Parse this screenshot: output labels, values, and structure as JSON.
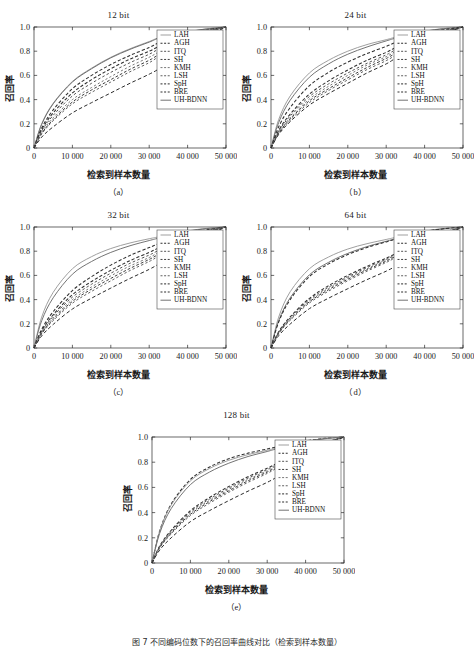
{
  "figure": {
    "caption": "图 7   不同编码位数下的召回率曲线对比（检索到样本数量）",
    "yaxis_label": "召回率",
    "xaxis_label": "检索到样本数量",
    "xticks": [
      "0",
      "10 000",
      "20 000",
      "30 000",
      "40 000",
      "50 000"
    ],
    "xtick_values": [
      0,
      10000,
      20000,
      30000,
      40000,
      50000
    ],
    "yticks": [
      "0",
      "0.2",
      "0.4",
      "0.6",
      "0.8",
      "1.0"
    ],
    "ytick_values": [
      0,
      0.2,
      0.4,
      0.6,
      0.8,
      1.0
    ],
    "xlim": [
      0,
      50000
    ],
    "ylim": [
      0,
      1.0
    ],
    "colors": {
      "axis": "#2a2a2a",
      "curve": "#3a3a3a",
      "curve_light": "#8d8d8d",
      "legend_border": "#4a4a4a",
      "background": "#ffffff"
    },
    "panels": [
      {
        "id": "a",
        "title": "12 bit",
        "caption": "（a）"
      },
      {
        "id": "b",
        "title": "24 bit",
        "caption": "（b）"
      },
      {
        "id": "c",
        "title": "32 bit",
        "caption": "（c）"
      },
      {
        "id": "d",
        "title": "64 bit",
        "caption": "（d）"
      },
      {
        "id": "e",
        "title": "128 bit",
        "caption": "（e）"
      }
    ],
    "legend_entries": [
      {
        "label": "LAH",
        "style": "solid"
      },
      {
        "label": "AGH",
        "style": "dotted"
      },
      {
        "label": "ITQ",
        "style": "dotted"
      },
      {
        "label": "SH",
        "style": "dotted"
      },
      {
        "label": "KMH",
        "style": "dotted"
      },
      {
        "label": "LSH",
        "style": "dotted"
      },
      {
        "label": "SpH",
        "style": "dotted"
      },
      {
        "label": "BRE",
        "style": "dotted"
      },
      {
        "label": "UH-BDNN",
        "style": "solid"
      }
    ]
  },
  "chart_data": [
    {
      "type": "line",
      "title": "12 bit",
      "panel": "a",
      "xlabel": "检索到样本数量",
      "ylabel": "召回率",
      "xlim": [
        0,
        50000
      ],
      "ylim": [
        0,
        1.0
      ],
      "grid": false,
      "legend_position": "upper-right",
      "x": [
        0,
        2000,
        5000,
        10000,
        15000,
        20000,
        25000,
        30000,
        33000,
        40000,
        45000,
        50000
      ],
      "series": [
        {
          "name": "LAH",
          "values": [
            0.0,
            0.2,
            0.37,
            0.55,
            0.66,
            0.75,
            0.82,
            0.88,
            0.915,
            0.96,
            0.985,
            1.0
          ]
        },
        {
          "name": "UH-BDNN",
          "values": [
            0.0,
            0.195,
            0.365,
            0.545,
            0.655,
            0.745,
            0.815,
            0.875,
            0.912,
            0.958,
            0.984,
            1.0
          ]
        },
        {
          "name": "AGH",
          "values": [
            0.0,
            0.165,
            0.315,
            0.49,
            0.6,
            0.69,
            0.765,
            0.83,
            0.875,
            0.94,
            0.975,
            1.0
          ]
        },
        {
          "name": "BRE",
          "values": [
            0.0,
            0.15,
            0.29,
            0.455,
            0.565,
            0.655,
            0.735,
            0.8,
            0.845,
            0.925,
            0.968,
            1.0
          ]
        },
        {
          "name": "ITQ",
          "values": [
            0.0,
            0.14,
            0.27,
            0.43,
            0.535,
            0.625,
            0.705,
            0.775,
            0.825,
            0.915,
            0.963,
            1.0
          ]
        },
        {
          "name": "KMH",
          "values": [
            0.0,
            0.13,
            0.25,
            0.4,
            0.5,
            0.59,
            0.675,
            0.75,
            0.8,
            0.9,
            0.958,
            1.0
          ]
        },
        {
          "name": "SH",
          "values": [
            0.0,
            0.12,
            0.235,
            0.38,
            0.48,
            0.565,
            0.65,
            0.725,
            0.78,
            0.89,
            0.952,
            1.0
          ]
        },
        {
          "name": "LSH",
          "values": [
            0.0,
            0.115,
            0.225,
            0.365,
            0.46,
            0.545,
            0.63,
            0.705,
            0.765,
            0.885,
            0.95,
            1.0
          ]
        },
        {
          "name": "SpH",
          "values": [
            0.0,
            0.09,
            0.175,
            0.29,
            0.375,
            0.455,
            0.535,
            0.61,
            0.665,
            0.825,
            0.92,
            1.0
          ]
        }
      ]
    },
    {
      "type": "line",
      "title": "24 bit",
      "panel": "b",
      "xlabel": "检索到样本数量",
      "ylabel": "召回率",
      "xlim": [
        0,
        50000
      ],
      "ylim": [
        0,
        1.0
      ],
      "grid": false,
      "legend_position": "upper-right",
      "x": [
        0,
        2000,
        5000,
        10000,
        15000,
        20000,
        25000,
        30000,
        33000,
        40000,
        45000,
        50000
      ],
      "series": [
        {
          "name": "LAH",
          "values": [
            0.0,
            0.235,
            0.43,
            0.62,
            0.725,
            0.8,
            0.855,
            0.895,
            0.92,
            0.965,
            0.988,
            1.0
          ]
        },
        {
          "name": "UH-BDNN",
          "values": [
            0.0,
            0.21,
            0.395,
            0.585,
            0.695,
            0.775,
            0.835,
            0.885,
            0.912,
            0.962,
            0.986,
            1.0
          ]
        },
        {
          "name": "AGH",
          "values": [
            0.0,
            0.175,
            0.335,
            0.515,
            0.625,
            0.71,
            0.78,
            0.84,
            0.878,
            0.945,
            0.978,
            1.0
          ]
        },
        {
          "name": "BRE",
          "values": [
            0.0,
            0.145,
            0.28,
            0.445,
            0.555,
            0.645,
            0.725,
            0.79,
            0.838,
            0.925,
            0.968,
            1.0
          ]
        },
        {
          "name": "ITQ",
          "values": [
            0.0,
            0.138,
            0.265,
            0.425,
            0.53,
            0.62,
            0.7,
            0.77,
            0.82,
            0.915,
            0.965,
            1.0
          ]
        },
        {
          "name": "KMH",
          "values": [
            0.0,
            0.13,
            0.25,
            0.405,
            0.51,
            0.6,
            0.685,
            0.755,
            0.805,
            0.905,
            0.96,
            1.0
          ]
        },
        {
          "name": "SH",
          "values": [
            0.0,
            0.124,
            0.24,
            0.39,
            0.49,
            0.58,
            0.665,
            0.74,
            0.79,
            0.895,
            0.955,
            1.0
          ]
        },
        {
          "name": "LSH",
          "values": [
            0.0,
            0.118,
            0.23,
            0.375,
            0.475,
            0.563,
            0.648,
            0.722,
            0.775,
            0.888,
            0.95,
            1.0
          ]
        },
        {
          "name": "SpH",
          "values": [
            0.0,
            0.112,
            0.218,
            0.355,
            0.45,
            0.535,
            0.62,
            0.695,
            0.752,
            0.875,
            0.945,
            1.0
          ]
        }
      ]
    },
    {
      "type": "line",
      "title": "32 bit",
      "panel": "c",
      "xlabel": "检索到样本数量",
      "ylabel": "召回率",
      "xlim": [
        0,
        50000
      ],
      "ylim": [
        0,
        1.0
      ],
      "grid": false,
      "legend_position": "upper-right",
      "x": [
        0,
        2000,
        5000,
        10000,
        15000,
        20000,
        25000,
        30000,
        33000,
        40000,
        45000,
        50000
      ],
      "series": [
        {
          "name": "LAH",
          "values": [
            0.0,
            0.255,
            0.46,
            0.655,
            0.755,
            0.822,
            0.868,
            0.903,
            0.922,
            0.967,
            0.989,
            1.0
          ]
        },
        {
          "name": "UH-BDNN",
          "values": [
            0.0,
            0.225,
            0.415,
            0.61,
            0.715,
            0.79,
            0.845,
            0.888,
            0.912,
            0.963,
            0.987,
            1.0
          ]
        },
        {
          "name": "AGH",
          "values": [
            0.0,
            0.155,
            0.3,
            0.475,
            0.59,
            0.685,
            0.765,
            0.83,
            0.868,
            0.942,
            0.977,
            1.0
          ]
        },
        {
          "name": "BRE",
          "values": [
            0.0,
            0.142,
            0.275,
            0.44,
            0.55,
            0.642,
            0.722,
            0.79,
            0.835,
            0.925,
            0.968,
            1.0
          ]
        },
        {
          "name": "ITQ",
          "values": [
            0.0,
            0.135,
            0.262,
            0.42,
            0.527,
            0.618,
            0.7,
            0.768,
            0.815,
            0.915,
            0.965,
            1.0
          ]
        },
        {
          "name": "KMH",
          "values": [
            0.0,
            0.128,
            0.248,
            0.4,
            0.505,
            0.596,
            0.678,
            0.748,
            0.798,
            0.905,
            0.958,
            1.0
          ]
        },
        {
          "name": "SH",
          "values": [
            0.0,
            0.122,
            0.237,
            0.385,
            0.487,
            0.575,
            0.658,
            0.732,
            0.783,
            0.893,
            0.953,
            1.0
          ]
        },
        {
          "name": "LSH",
          "values": [
            0.0,
            0.116,
            0.226,
            0.37,
            0.468,
            0.555,
            0.64,
            0.715,
            0.768,
            0.885,
            0.949,
            1.0
          ]
        },
        {
          "name": "SpH",
          "values": [
            0.0,
            0.1,
            0.195,
            0.322,
            0.412,
            0.495,
            0.575,
            0.65,
            0.705,
            0.845,
            0.93,
            1.0
          ]
        }
      ]
    },
    {
      "type": "line",
      "title": "64 bit",
      "panel": "d",
      "xlabel": "检索到样本数量",
      "ylabel": "召回率",
      "xlim": [
        0,
        50000
      ],
      "ylim": [
        0,
        1.0
      ],
      "grid": false,
      "legend_position": "upper-right",
      "x": [
        0,
        2000,
        5000,
        10000,
        15000,
        20000,
        25000,
        30000,
        33000,
        40000,
        45000,
        50000
      ],
      "series": [
        {
          "name": "LAH",
          "values": [
            0.0,
            0.255,
            0.465,
            0.655,
            0.752,
            0.818,
            0.862,
            0.897,
            0.918,
            0.965,
            0.988,
            1.0
          ]
        },
        {
          "name": "UH-BDNN",
          "values": [
            0.0,
            0.225,
            0.415,
            0.605,
            0.708,
            0.782,
            0.838,
            0.882,
            0.908,
            0.962,
            0.986,
            1.0
          ]
        },
        {
          "name": "AGH",
          "values": [
            0.0,
            0.215,
            0.4,
            0.59,
            0.695,
            0.772,
            0.83,
            0.877,
            0.905,
            0.96,
            0.985,
            1.0
          ]
        },
        {
          "name": "BRE",
          "values": [
            0.0,
            0.135,
            0.258,
            0.41,
            0.515,
            0.6,
            0.675,
            0.742,
            0.788,
            0.895,
            0.955,
            1.0
          ]
        },
        {
          "name": "ITQ",
          "values": [
            0.0,
            0.13,
            0.25,
            0.4,
            0.503,
            0.588,
            0.665,
            0.733,
            0.78,
            0.89,
            0.952,
            1.0
          ]
        },
        {
          "name": "KMH",
          "values": [
            0.0,
            0.126,
            0.243,
            0.39,
            0.492,
            0.578,
            0.655,
            0.725,
            0.773,
            0.888,
            0.95,
            1.0
          ]
        },
        {
          "name": "SH",
          "values": [
            0.0,
            0.122,
            0.236,
            0.382,
            0.482,
            0.568,
            0.646,
            0.717,
            0.766,
            0.884,
            0.948,
            1.0
          ]
        },
        {
          "name": "LSH",
          "values": [
            0.0,
            0.118,
            0.229,
            0.372,
            0.47,
            0.556,
            0.635,
            0.707,
            0.757,
            0.88,
            0.946,
            1.0
          ]
        },
        {
          "name": "SpH",
          "values": [
            0.0,
            0.102,
            0.198,
            0.325,
            0.412,
            0.49,
            0.565,
            0.635,
            0.688,
            0.83,
            0.925,
            1.0
          ]
        }
      ]
    },
    {
      "type": "line",
      "title": "128 bit",
      "panel": "e",
      "xlabel": "检索到样本数量",
      "ylabel": "召回率",
      "xlim": [
        0,
        50000
      ],
      "ylim": [
        0,
        1.0
      ],
      "grid": false,
      "legend_position": "upper-right",
      "x": [
        0,
        2000,
        5000,
        10000,
        15000,
        20000,
        25000,
        30000,
        33000,
        40000,
        45000,
        50000
      ],
      "series": [
        {
          "name": "AGH",
          "values": [
            0.0,
            0.255,
            0.468,
            0.663,
            0.762,
            0.828,
            0.872,
            0.905,
            0.925,
            0.968,
            0.989,
            1.0
          ]
        },
        {
          "name": "LAH",
          "values": [
            0.0,
            0.252,
            0.46,
            0.652,
            0.75,
            0.815,
            0.86,
            0.895,
            0.916,
            0.964,
            0.988,
            1.0
          ]
        },
        {
          "name": "UH-BDNN",
          "values": [
            0.0,
            0.235,
            0.432,
            0.622,
            0.722,
            0.792,
            0.845,
            0.885,
            0.91,
            0.962,
            0.986,
            1.0
          ]
        },
        {
          "name": "BRE",
          "values": [
            0.0,
            0.135,
            0.26,
            0.415,
            0.52,
            0.607,
            0.685,
            0.752,
            0.798,
            0.9,
            0.956,
            1.0
          ]
        },
        {
          "name": "ITQ",
          "values": [
            0.0,
            0.13,
            0.252,
            0.405,
            0.508,
            0.595,
            0.674,
            0.742,
            0.79,
            0.896,
            0.954,
            1.0
          ]
        },
        {
          "name": "KMH",
          "values": [
            0.0,
            0.127,
            0.245,
            0.395,
            0.497,
            0.584,
            0.663,
            0.732,
            0.781,
            0.891,
            0.951,
            1.0
          ]
        },
        {
          "name": "SH",
          "values": [
            0.0,
            0.123,
            0.238,
            0.386,
            0.487,
            0.573,
            0.652,
            0.722,
            0.772,
            0.886,
            0.949,
            1.0
          ]
        },
        {
          "name": "LSH",
          "values": [
            0.0,
            0.119,
            0.231,
            0.376,
            0.475,
            0.561,
            0.64,
            0.711,
            0.762,
            0.881,
            0.947,
            1.0
          ]
        },
        {
          "name": "SpH",
          "values": [
            0.0,
            0.103,
            0.2,
            0.328,
            0.416,
            0.495,
            0.57,
            0.64,
            0.692,
            0.834,
            0.927,
            1.0
          ]
        }
      ]
    }
  ]
}
